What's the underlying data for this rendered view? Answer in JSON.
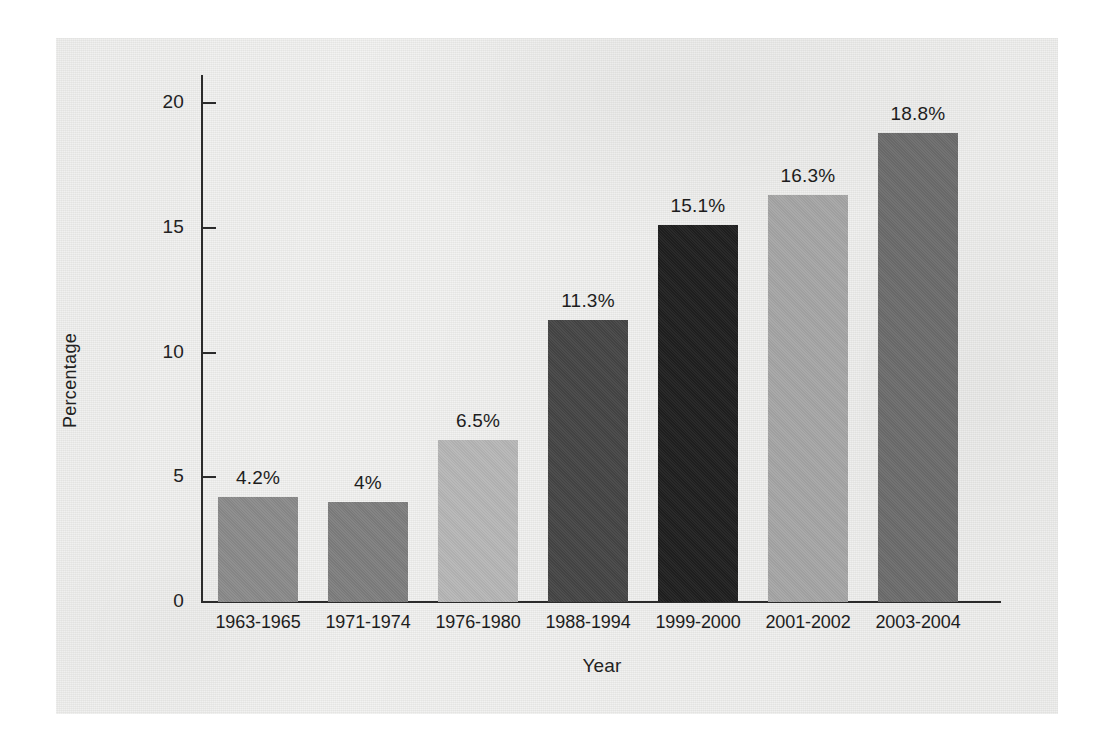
{
  "chart_data": {
    "type": "bar",
    "title": "",
    "xlabel": "Year",
    "ylabel": "Percentage",
    "categories": [
      "1963-1965",
      "1971-1974",
      "1976-1980",
      "1988-1994",
      "1999-2000",
      "2001-2002",
      "2003-2004"
    ],
    "values": [
      4.2,
      4,
      6.5,
      11.3,
      15.1,
      16.3,
      18.8
    ],
    "data_labels": [
      "4.2%",
      "4%",
      "6.5%",
      "11.3%",
      "15.1%",
      "16.3%",
      "18.8%"
    ],
    "bar_colors": [
      "#8a8a8a",
      "#7e7e7e",
      "#b6b6b6",
      "#454545",
      "#1f1f1f",
      "#a5a5a5",
      "#6c6c6c"
    ],
    "ylim": [
      0,
      20
    ],
    "yticks": [
      0,
      5,
      10,
      15,
      20
    ],
    "ytick_labels": [
      "0",
      "5",
      "10",
      "15",
      "20"
    ],
    "grid": false,
    "legend": "none",
    "axis_color": "#2b2b2b",
    "text_color": "#1d1d1d",
    "background_color": "#e9e9e7"
  }
}
